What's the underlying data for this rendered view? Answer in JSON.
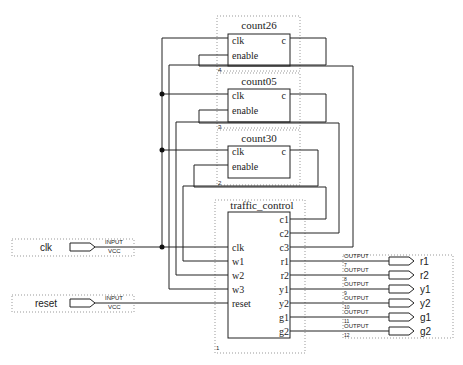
{
  "diagram": {
    "type": "block-schematic",
    "blocks": [
      {
        "id": "count26",
        "title": "count26",
        "inputs": [
          "clk",
          "enable"
        ],
        "outputs": [
          "c"
        ],
        "instance_number": "4"
      },
      {
        "id": "count05",
        "title": "count05",
        "inputs": [
          "clk",
          "enable"
        ],
        "outputs": [
          "c"
        ],
        "instance_number": "3"
      },
      {
        "id": "count30",
        "title": "count30",
        "inputs": [
          "clk",
          "enable"
        ],
        "outputs": [
          "c"
        ],
        "instance_number": "2"
      },
      {
        "id": "traffic_control",
        "title": "traffic_control",
        "inputs": [
          "clk",
          "w1",
          "w2",
          "w3",
          "reset"
        ],
        "outputs": [
          "c1",
          "c2",
          "c3",
          "r1",
          "r2",
          "y1",
          "y2",
          "g1",
          "g2"
        ],
        "instance_number": "1"
      }
    ],
    "input_pins": [
      {
        "name": "clk",
        "type": "INPUT",
        "default": "VCC"
      },
      {
        "name": "reset",
        "type": "INPUT",
        "default": "VCC"
      }
    ],
    "output_pins": [
      {
        "name": "r1",
        "type": "OUTPUT",
        "pin": "7"
      },
      {
        "name": "r2",
        "type": "OUTPUT",
        "pin": "8"
      },
      {
        "name": "y1",
        "type": "OUTPUT",
        "pin": "9"
      },
      {
        "name": "y2",
        "type": "OUTPUT",
        "pin": "10"
      },
      {
        "name": "g1",
        "type": "OUTPUT",
        "pin": "11"
      },
      {
        "name": "g2",
        "type": "OUTPUT",
        "pin": "12"
      }
    ],
    "connections": [
      "clk -> count26.clk, count05.clk, count30.clk, traffic_control.clk",
      "reset -> traffic_control.reset",
      "count26.c -> traffic_control.w3",
      "count05.c -> traffic_control.w2",
      "count30.c -> traffic_control.w1",
      "traffic_control.c1 -> count30.enable",
      "traffic_control.c2 -> count05.enable",
      "traffic_control.c3 -> count26.enable",
      "traffic_control.r1..g2 -> output pins"
    ]
  }
}
